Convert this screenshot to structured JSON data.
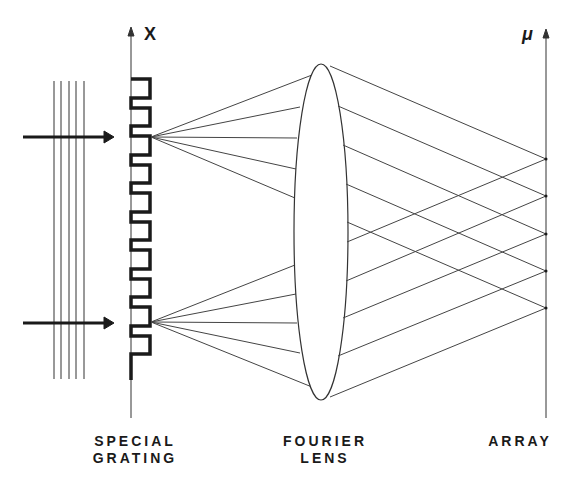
{
  "diagram": {
    "type": "optics-schematic",
    "axis_labels": {
      "grating_axis": "X",
      "array_axis": "μ"
    },
    "components": [
      {
        "id": "grating",
        "label_line1": "SPECIAL",
        "label_line2": "GRATING"
      },
      {
        "id": "lens",
        "label_line1": "FOURIER",
        "label_line2": "LENS"
      },
      {
        "id": "array",
        "label_line1": "ARRAY"
      }
    ],
    "colors": {
      "ink": "#1a1a1a",
      "background": "#ffffff"
    },
    "incident_wavefronts": 5,
    "incident_beams": 2,
    "grating_teeth": 10,
    "rays_per_source": 5,
    "array_focal_points": 5
  }
}
